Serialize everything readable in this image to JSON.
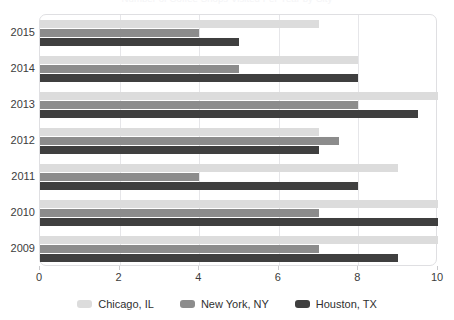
{
  "chart_data": {
    "type": "bar",
    "orientation": "horizontal",
    "title": "Number of Coffee Shops Visited Per Year by City",
    "xlabel": "",
    "ylabel": "",
    "categories": [
      "2015",
      "2014",
      "2013",
      "2012",
      "2011",
      "2010",
      "2009"
    ],
    "series": [
      {
        "name": "Chicago, IL",
        "color": "#dcdcdc",
        "values": [
          7,
          8,
          10,
          7,
          9,
          10,
          10
        ]
      },
      {
        "name": "New York, NY",
        "color": "#8c8c8c",
        "values": [
          4,
          5,
          8,
          7.5,
          4,
          7,
          7
        ]
      },
      {
        "name": "Houston, TX",
        "color": "#3f3f3f",
        "values": [
          5,
          8,
          9.5,
          7,
          8,
          10,
          9
        ]
      }
    ],
    "xlim": [
      0,
      10
    ],
    "xticks": [
      "0",
      "2",
      "4",
      "6",
      "8",
      "10"
    ],
    "xtick_values": [
      0,
      2,
      4,
      6,
      8,
      10
    ],
    "grid": "vertical",
    "legend_position": "bottom"
  },
  "legend": {
    "items": [
      {
        "label": "Chicago, IL",
        "color": "#dcdcdc"
      },
      {
        "label": "New York, NY",
        "color": "#8c8c8c"
      },
      {
        "label": "Houston, TX",
        "color": "#3f3f3f"
      }
    ]
  }
}
